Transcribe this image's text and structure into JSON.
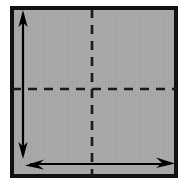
{
  "figure": {
    "title": "Square panel with dashed center cross and dimension arrows",
    "canvas": {
      "width": 184,
      "height": 189,
      "background": "#ffffff"
    },
    "panel": {
      "name": "gray-square-panel",
      "x": 10,
      "y": 6,
      "width": 168,
      "height": 172,
      "fill": "#a9a9a9",
      "border_color": "#111111",
      "border_width": 4
    },
    "center_lines": {
      "color": "#1a1a1a",
      "stroke_width": 2.6,
      "dash_pattern": "9 7",
      "vertical": {
        "name": "vertical-center-dashed-line",
        "x": 92,
        "y1": 8,
        "y2": 176
      },
      "horizontal": {
        "name": "horizontal-center-dashed-line",
        "y": 89,
        "x1": 12,
        "x2": 176
      }
    },
    "arrows": {
      "color": "#000000",
      "shaft_width": 2.2,
      "head_length": 15,
      "head_half_width": 5,
      "vertical_arrow": {
        "name": "vertical-double-arrow",
        "label": "height dimension arrow",
        "x": 23,
        "y_top": 11,
        "y_bottom": 158,
        "double_headed": true
      },
      "horizontal_arrow": {
        "name": "horizontal-double-arrow",
        "label": "width dimension arrow",
        "y": 164,
        "x_left": 26,
        "x_right": 174,
        "double_headed": true
      }
    }
  }
}
